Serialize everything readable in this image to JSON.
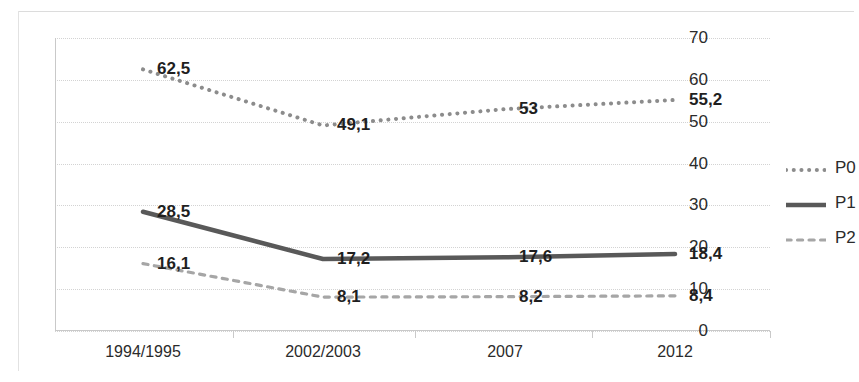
{
  "chart_data": {
    "type": "line",
    "title": "",
    "subtitle": "",
    "xlabel": "",
    "ylabel": "",
    "categories": [
      "1994/1995",
      "2002/2003",
      "2007",
      "2012"
    ],
    "ylim": [
      0,
      70
    ],
    "ytick_labels": [
      "0",
      "10",
      "20",
      "30",
      "40",
      "50",
      "60",
      "70"
    ],
    "ytick_values": [
      0,
      10,
      20,
      30,
      40,
      50,
      60,
      70
    ],
    "grid": true,
    "legend_position": "right",
    "series": [
      {
        "name": "P0",
        "style": "dotted",
        "color": "#8c8c8c",
        "values": [
          62.5,
          49.1,
          53,
          55.2
        ],
        "labels": [
          "62,5",
          "49,1",
          "53",
          "55,2"
        ]
      },
      {
        "name": "P1",
        "style": "solid",
        "color": "#595959",
        "values": [
          28.5,
          17.2,
          17.6,
          18.4
        ],
        "labels": [
          "28,5",
          "17,2",
          "17,6",
          "18,4"
        ]
      },
      {
        "name": "P2",
        "style": "dashed",
        "color": "#a6a6a6",
        "values": [
          16.1,
          8.1,
          8.2,
          8.4
        ],
        "labels": [
          "16,1",
          "8,1",
          "8,2",
          "8,4"
        ]
      }
    ]
  },
  "legend": {
    "items": [
      {
        "label": "P0"
      },
      {
        "label": "P1"
      },
      {
        "label": "P2"
      }
    ]
  }
}
